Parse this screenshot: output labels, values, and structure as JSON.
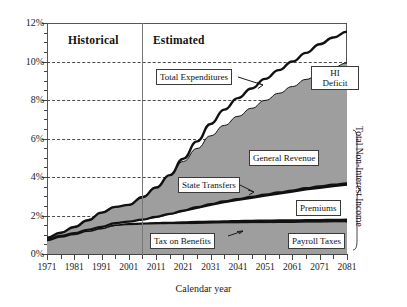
{
  "chart_data": {
    "type": "area",
    "title": "",
    "xlabel": "Calendar year",
    "ylabel": "",
    "xlim": [
      1971,
      2081
    ],
    "ylim": [
      0,
      12
    ],
    "y_tick_labels": [
      "0%",
      "2%",
      "4%",
      "6%",
      "8%",
      "10%",
      "12%"
    ],
    "y_tick_values": [
      0,
      2,
      4,
      6,
      8,
      10,
      12
    ],
    "x_tick_labels": [
      "1971",
      "1981",
      "1991",
      "2001",
      "2011",
      "2021",
      "2031",
      "2041",
      "2051",
      "2061",
      "2071",
      "2081"
    ],
    "x_tick_values": [
      1971,
      1981,
      1991,
      2001,
      2011,
      2021,
      2031,
      2041,
      2051,
      2061,
      2071,
      2081
    ],
    "grid": true,
    "legend_position": "inline-callouts",
    "period_divider_year": 2006,
    "periods": [
      {
        "label": "Historical",
        "start": 1971,
        "end": 2006
      },
      {
        "label": "Estimated",
        "start": 2006,
        "end": 2081
      }
    ],
    "x": [
      1971,
      1976,
      1981,
      1986,
      1991,
      1996,
      2001,
      2006,
      2011,
      2016,
      2021,
      2026,
      2031,
      2036,
      2041,
      2046,
      2051,
      2056,
      2061,
      2066,
      2071,
      2076,
      2081
    ],
    "series": [
      {
        "name": "Total Expenditures",
        "type": "line",
        "style": "thick-black-line",
        "values": [
          0.85,
          1.1,
          1.4,
          1.75,
          2.15,
          2.45,
          2.55,
          2.95,
          3.45,
          4.1,
          4.95,
          5.85,
          6.75,
          7.5,
          8.1,
          8.6,
          9.1,
          9.55,
          10.0,
          10.45,
          10.9,
          11.25,
          11.55
        ]
      },
      {
        "name": "Payroll Taxes",
        "type": "area-band",
        "style": "gray-fill-bottom",
        "values": [
          0.7,
          0.88,
          1.02,
          1.18,
          1.32,
          1.45,
          1.5,
          1.52,
          1.53,
          1.54,
          1.55,
          1.56,
          1.57,
          1.58,
          1.59,
          1.6,
          1.6,
          1.61,
          1.61,
          1.62,
          1.62,
          1.63,
          1.63
        ]
      },
      {
        "name": "Tax on Benefits",
        "type": "area-band",
        "style": "thin-black-band",
        "values": [
          0.0,
          0.0,
          0.0,
          0.0,
          0.0,
          0.05,
          0.07,
          0.08,
          0.09,
          0.1,
          0.11,
          0.12,
          0.13,
          0.13,
          0.14,
          0.14,
          0.15,
          0.15,
          0.15,
          0.16,
          0.16,
          0.16,
          0.17
        ]
      },
      {
        "name": "Premiums",
        "type": "area-band",
        "style": "white-fill",
        "values": [
          0.05,
          0.06,
          0.07,
          0.08,
          0.09,
          0.1,
          0.11,
          0.15,
          0.25,
          0.38,
          0.52,
          0.66,
          0.8,
          0.92,
          1.02,
          1.12,
          1.22,
          1.32,
          1.42,
          1.52,
          1.6,
          1.68,
          1.74
        ]
      },
      {
        "name": "State Transfers",
        "type": "area-band",
        "style": "thick-black-band",
        "values": [
          0.0,
          0.0,
          0.0,
          0.0,
          0.0,
          0.0,
          0.0,
          0.04,
          0.06,
          0.07,
          0.08,
          0.09,
          0.09,
          0.1,
          0.1,
          0.11,
          0.11,
          0.12,
          0.12,
          0.12,
          0.13,
          0.13,
          0.13
        ]
      },
      {
        "name": "General Revenue",
        "type": "area-band",
        "style": "gray-fill-top",
        "values": [
          0.1,
          0.16,
          0.3,
          0.48,
          0.73,
          0.85,
          0.87,
          1.2,
          1.55,
          2.0,
          2.55,
          3.05,
          3.55,
          3.95,
          4.3,
          4.6,
          4.9,
          5.15,
          5.4,
          5.65,
          5.9,
          6.1,
          6.25
        ]
      },
      {
        "name": "Total Non-Interest Income",
        "type": "stack-total",
        "style": "bracket-annotation",
        "values": [
          0.85,
          1.1,
          1.39,
          1.74,
          2.14,
          2.45,
          2.55,
          2.99,
          3.48,
          4.09,
          4.81,
          5.48,
          6.14,
          6.68,
          7.15,
          7.57,
          7.98,
          8.35,
          8.7,
          9.07,
          9.41,
          9.7,
          9.92
        ]
      },
      {
        "name": "HI Deficit",
        "type": "gap-annotation",
        "style": "white-gap",
        "values": [
          0.0,
          0.0,
          0.01,
          0.01,
          0.01,
          0.0,
          0.0,
          0.0,
          0.0,
          0.01,
          0.14,
          0.37,
          0.61,
          0.82,
          0.95,
          1.03,
          1.12,
          1.2,
          1.3,
          1.38,
          1.49,
          1.55,
          1.63
        ]
      }
    ],
    "annotations": [
      {
        "name": "total-expenditures",
        "label": "Total Expenditures",
        "has_arrow": true
      },
      {
        "name": "hi-deficit",
        "label_line1": "HI",
        "label_line2": "Deficit",
        "has_arrow": false
      },
      {
        "name": "general-revenue",
        "label": "General Revenue",
        "has_arrow": false
      },
      {
        "name": "state-transfers",
        "label": "State Transfers",
        "has_arrow": true
      },
      {
        "name": "premiums",
        "label": "Premiums",
        "has_arrow": false
      },
      {
        "name": "tax-on-benefits",
        "label": "Tax on Benefits",
        "has_arrow": true
      },
      {
        "name": "payroll-taxes",
        "label": "Payroll Taxes",
        "has_arrow": false
      },
      {
        "name": "total-non-interest-income",
        "label": "Total Non-Interest Income",
        "has_arrow": false
      }
    ],
    "colors": {
      "fill_gray": "#9e9e9e",
      "fill_white": "#ffffff",
      "line_black": "#111111",
      "grid": "#4a4a4a",
      "axis": "#444444",
      "background": "#ffffff"
    }
  },
  "labels": {
    "historical": "Historical",
    "estimated": "Estimated",
    "total_expenditures": "Total Expenditures",
    "hi_line1": "HI",
    "hi_line2": "Deficit",
    "general_revenue": "General Revenue",
    "state_transfers": "State Transfers",
    "premiums": "Premiums",
    "tax_on_benefits": "Tax on Benefits",
    "payroll_taxes": "Payroll Taxes",
    "total_non_interest_income": "Total Non-Interest Income",
    "x_axis_title": "Calendar year"
  },
  "y_axis": {
    "ticks": [
      "12%",
      "10%",
      "8%",
      "6%",
      "4%",
      "2%",
      "0%"
    ]
  },
  "x_axis": {
    "ticks": [
      "1971",
      "1981",
      "1991",
      "2001",
      "2011",
      "2021",
      "2031",
      "2041",
      "2051",
      "2061",
      "2071",
      "2081"
    ]
  }
}
